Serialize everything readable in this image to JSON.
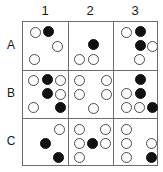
{
  "figure": {
    "title": "",
    "grid": {
      "columns": [
        "1",
        "2",
        "3"
      ],
      "rows": [
        "A",
        "B",
        "C"
      ],
      "cell_width": 45,
      "cell_height": 48,
      "border_color": "#6d6d6d",
      "open_circle_color": "#4c4c4c",
      "filled_circle_color": "#111111"
    },
    "legend_open": "open circle",
    "legend_filled": "filled circle",
    "cells": [
      {
        "id": "A1",
        "row": "A",
        "column": "1",
        "circles": [
          {
            "x": 7,
            "y": 5,
            "state": "open"
          },
          {
            "x": 20,
            "y": 4,
            "state": "filled"
          },
          {
            "x": 29,
            "y": 19,
            "state": "open"
          },
          {
            "x": 6,
            "y": 32,
            "state": "open"
          }
        ]
      },
      {
        "id": "A2",
        "row": "A",
        "column": "2",
        "circles": [
          {
            "x": 19,
            "y": 17,
            "state": "filled"
          },
          {
            "x": 5,
            "y": 32,
            "state": "open"
          },
          {
            "x": 19,
            "y": 32,
            "state": "open"
          }
        ]
      },
      {
        "id": "A3",
        "row": "A",
        "column": "3",
        "circles": [
          {
            "x": 6,
            "y": 5,
            "state": "open"
          },
          {
            "x": 20,
            "y": 4,
            "state": "filled"
          },
          {
            "x": 20,
            "y": 18,
            "state": "filled"
          },
          {
            "x": 32,
            "y": 19,
            "state": "open"
          },
          {
            "x": 19,
            "y": 32,
            "state": "open"
          }
        ]
      },
      {
        "id": "B1",
        "row": "B",
        "column": "1",
        "circles": [
          {
            "x": 5,
            "y": 4,
            "state": "open"
          },
          {
            "x": 19,
            "y": 3,
            "state": "filled"
          },
          {
            "x": 32,
            "y": 4,
            "state": "open"
          },
          {
            "x": 19,
            "y": 17,
            "state": "filled"
          },
          {
            "x": 32,
            "y": 18,
            "state": "open"
          },
          {
            "x": 5,
            "y": 31,
            "state": "open"
          },
          {
            "x": 32,
            "y": 31,
            "state": "filled"
          }
        ]
      },
      {
        "id": "B2",
        "row": "B",
        "column": "2",
        "circles": [
          {
            "x": 5,
            "y": 4,
            "state": "open"
          },
          {
            "x": 32,
            "y": 4,
            "state": "open"
          },
          {
            "x": 5,
            "y": 18,
            "state": "open"
          },
          {
            "x": 32,
            "y": 18,
            "state": "open"
          },
          {
            "x": 19,
            "y": 32,
            "state": "open"
          }
        ]
      },
      {
        "id": "B3",
        "row": "B",
        "column": "3",
        "circles": [
          {
            "x": 20,
            "y": 3,
            "state": "filled"
          },
          {
            "x": 6,
            "y": 17,
            "state": "open"
          },
          {
            "x": 20,
            "y": 17,
            "state": "filled"
          },
          {
            "x": 6,
            "y": 31,
            "state": "open"
          },
          {
            "x": 19,
            "y": 31,
            "state": "open"
          },
          {
            "x": 32,
            "y": 31,
            "state": "filled"
          }
        ]
      },
      {
        "id": "C1",
        "row": "C",
        "column": "1",
        "circles": [
          {
            "x": 31,
            "y": 4,
            "state": "open"
          },
          {
            "x": 17,
            "y": 18,
            "state": "filled"
          },
          {
            "x": 30,
            "y": 32,
            "state": "filled"
          }
        ]
      },
      {
        "id": "C2",
        "row": "C",
        "column": "2",
        "circles": [
          {
            "x": 5,
            "y": 4,
            "state": "open"
          },
          {
            "x": 31,
            "y": 4,
            "state": "open"
          },
          {
            "x": 5,
            "y": 18,
            "state": "open"
          },
          {
            "x": 18,
            "y": 18,
            "state": "filled"
          },
          {
            "x": 31,
            "y": 18,
            "state": "open"
          },
          {
            "x": 5,
            "y": 32,
            "state": "open"
          }
        ]
      },
      {
        "id": "C3",
        "row": "C",
        "column": "3",
        "circles": [
          {
            "x": 6,
            "y": 4,
            "state": "open"
          },
          {
            "x": 6,
            "y": 18,
            "state": "open"
          },
          {
            "x": 31,
            "y": 18,
            "state": "open"
          },
          {
            "x": 6,
            "y": 32,
            "state": "open"
          },
          {
            "x": 31,
            "y": 32,
            "state": "filled"
          }
        ]
      }
    ]
  }
}
